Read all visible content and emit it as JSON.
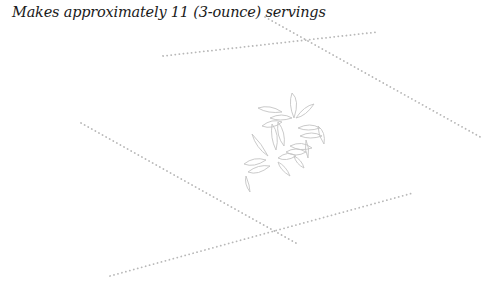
{
  "caption": {
    "text": "Makes approximately 11 (3-ounce) servings"
  },
  "decoration": {
    "line_color": "#b8b8b8",
    "leaf_color": "#c4c4c4",
    "dotted_lines": [
      {
        "x1": 163,
        "y1": 56,
        "x2": 378,
        "y2": 32
      },
      {
        "x1": 265,
        "y1": 17,
        "x2": 482,
        "y2": 138
      },
      {
        "x1": 81,
        "y1": 123,
        "x2": 296,
        "y2": 243
      },
      {
        "x1": 110,
        "y1": 276,
        "x2": 413,
        "y2": 193
      }
    ],
    "icon": "leaves-icon"
  }
}
